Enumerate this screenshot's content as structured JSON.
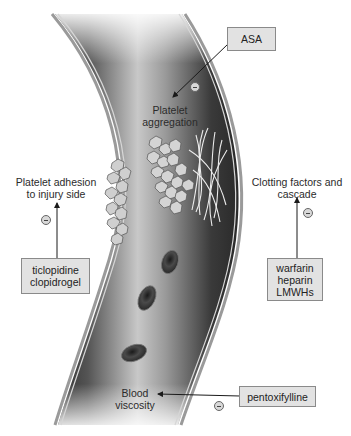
{
  "diagram": {
    "title": "",
    "vessel": {
      "fill_dark": "#3a3a3a",
      "fill_light": "#e6e6e6",
      "wall": "#b8b8b8"
    },
    "drugs": {
      "asa": {
        "label": "ASA"
      },
      "ticlopidine": {
        "lines": [
          "ticlopidine",
          "clopidrogel"
        ]
      },
      "anticoagulants": {
        "lines": [
          "warfarin",
          "heparin",
          "LMWHs"
        ]
      },
      "pentoxifylline": {
        "label": "pentoxifylline"
      }
    },
    "targets": {
      "aggregation": {
        "lines": [
          "Platelet",
          "aggregation"
        ]
      },
      "adhesion": {
        "lines": [
          "Platelet adhesion",
          "to injury side"
        ]
      },
      "clotting": {
        "lines": [
          "Clotting factors and",
          "cascade"
        ]
      },
      "viscosity": {
        "lines": [
          "Blood",
          "viscosity"
        ]
      }
    },
    "inhibition_symbol": "⊖",
    "box_fill": "#e2e2e2",
    "box_border": "#8a8a8a"
  }
}
